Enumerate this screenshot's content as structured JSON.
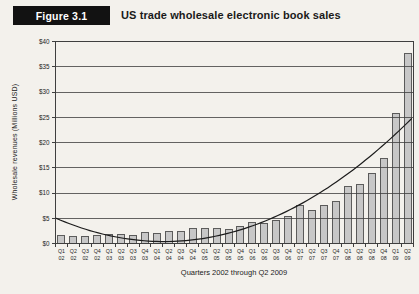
{
  "page_background": "#f3f1ec",
  "header": {
    "figure_label": "Figure 3.1",
    "title": "US trade wholesale electronic book sales",
    "label_bg": "#121212",
    "label_text_color": "#ffffff"
  },
  "chart_data": {
    "type": "bar",
    "title": "US trade wholesale electronic book sales",
    "categories": [
      "Q1 02",
      "Q2 02",
      "Q3 02",
      "Q4 02",
      "Q1 03",
      "Q2 03",
      "Q3 03",
      "Q4 03",
      "Q1 04",
      "Q2 04",
      "Q3 04",
      "Q4 04",
      "Q1 05",
      "Q2 05",
      "Q3 05",
      "Q4 05",
      "Q1 06",
      "Q2 06",
      "Q3 06",
      "Q4 06",
      "Q1 07",
      "Q2 07",
      "Q3 07",
      "Q4 07",
      "Q1 08",
      "Q2 08",
      "Q3 08",
      "Q4 08",
      "Q1 09",
      "Q2 09"
    ],
    "values": [
      1.5,
      1.3,
      1.4,
      1.6,
      1.8,
      1.8,
      1.6,
      2.1,
      2.0,
      2.3,
      2.3,
      2.9,
      2.9,
      2.9,
      2.7,
      3.4,
      4.1,
      4.0,
      4.6,
      5.4,
      7.5,
      6.6,
      7.6,
      8.3,
      11.2,
      11.6,
      13.9,
      16.8,
      25.8,
      37.6
    ],
    "xlabel": "Quarters 2002 through Q2 2009",
    "ylabel": "Wholesale revenues (Millions USD)",
    "ylim": [
      0,
      40
    ],
    "yticks": [
      "$0",
      "$5",
      "$10",
      "$15",
      "$20",
      "$25",
      "$30",
      "$35",
      "$40"
    ],
    "grid": true,
    "legend": "none",
    "trendline": {
      "type": "polynomial",
      "order": 2,
      "a": 0.0565,
      "b": -0.97,
      "c": 4.55,
      "start_value": 4.6,
      "min_value": 0.4,
      "end_value": 25.0
    },
    "colors": {
      "bar_fill": "#c7c7c7",
      "bar_stroke": "#4d4d4d",
      "line_color": "#1c1c1c",
      "axis_color": "#3f3f3f",
      "tick_text": "#1d1d1d"
    }
  }
}
